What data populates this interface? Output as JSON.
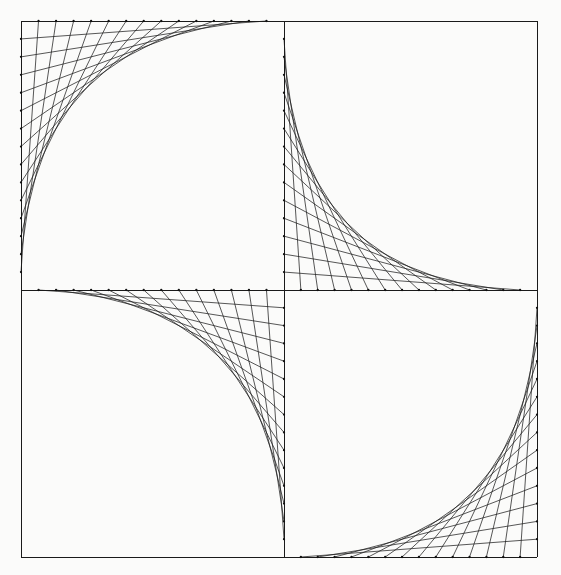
{
  "figure": {
    "kind": "string-art-geometric-line-drawing",
    "canvas": {
      "width": 561,
      "height": 575,
      "background_color": "#fbfbfa"
    },
    "style": {
      "line_color": "#1f1f1f",
      "frame_color": "#1a1a1a",
      "line_width": 0.75,
      "frame_width": 1,
      "node_dot_radius": 1.15
    },
    "frame": {
      "left": 21,
      "top": 21,
      "right": 537,
      "bottom": 557,
      "width": 516,
      "height": 536
    },
    "center": {
      "x": 284,
      "y": 290
    },
    "divisions": 15,
    "quadrants": [
      {
        "name": "top-left",
        "label": "Quadrant I (top-left)",
        "x0": 21,
        "y0": 21,
        "x1": 284,
        "y1": 290,
        "envelope_corner": "top-left",
        "axis_a": "top-edge",
        "axis_b": "left-edge",
        "pivot_x": 21,
        "pivot_y": 21,
        "end_a_x": 284,
        "end_a_y": 21,
        "end_b_x": 21,
        "end_b_y": 290
      },
      {
        "name": "top-right",
        "label": "Quadrant II (top-right)",
        "x0": 284,
        "y0": 21,
        "x1": 537,
        "y1": 290,
        "envelope_corner": "bottom-left",
        "axis_a": "left-edge",
        "axis_b": "bottom-edge",
        "pivot_x": 284,
        "pivot_y": 290,
        "end_a_x": 284,
        "end_a_y": 21,
        "end_b_x": 537,
        "end_b_y": 290
      },
      {
        "name": "bottom-left",
        "label": "Quadrant III (bottom-left)",
        "x0": 21,
        "y0": 290,
        "x1": 284,
        "y1": 557,
        "envelope_corner": "top-right",
        "axis_a": "top-edge",
        "axis_b": "right-edge",
        "pivot_x": 284,
        "pivot_y": 290,
        "end_a_x": 21,
        "end_a_y": 290,
        "end_b_x": 284,
        "end_b_y": 557
      },
      {
        "name": "bottom-right",
        "label": "Quadrant IV (bottom-right)",
        "x0": 284,
        "y0": 290,
        "x1": 537,
        "y1": 557,
        "envelope_corner": "bottom-right",
        "axis_a": "bottom-edge",
        "axis_b": "right-edge",
        "pivot_x": 537,
        "pivot_y": 557,
        "end_a_x": 284,
        "end_a_y": 557,
        "end_b_x": 537,
        "end_b_y": 290
      }
    ],
    "frame_segments": [
      {
        "name": "outer-top",
        "x1": 21,
        "y1": 21,
        "x2": 537,
        "y2": 21
      },
      {
        "name": "outer-right",
        "x1": 537,
        "y1": 21,
        "x2": 537,
        "y2": 557
      },
      {
        "name": "outer-bottom",
        "x1": 537,
        "y1": 557,
        "x2": 21,
        "y2": 557
      },
      {
        "name": "outer-left",
        "x1": 21,
        "y1": 557,
        "x2": 21,
        "y2": 21
      },
      {
        "name": "center-horizontal",
        "x1": 21,
        "y1": 290,
        "x2": 537,
        "y2": 290
      },
      {
        "name": "center-vertical",
        "x1": 284,
        "y1": 21,
        "x2": 284,
        "y2": 557
      }
    ]
  }
}
